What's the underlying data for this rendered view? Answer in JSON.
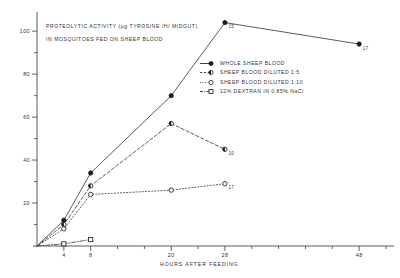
{
  "figure": {
    "title_line1": "PROTEOLYTIC ACTIVITY (µg TYROSINE /H/ MIDGUT)",
    "title_line2": "IN MOSQUITOES FED ON SHEEP BLOOD"
  },
  "axes": {
    "x_axis_title": "HOURS AFTER FEEDING",
    "y_tick_labels": [
      "20",
      "40",
      "60",
      "80",
      "100"
    ],
    "x_tick_labels": [
      "4",
      "8",
      "20",
      "28",
      "48"
    ]
  },
  "legend": {
    "items": [
      {
        "label": "WHOLE SHEEP BLOOD",
        "marker": "filled-circle",
        "line": "solid"
      },
      {
        "label": "SHEEP BLOOD DILUTED 1:5",
        "marker": "half-filled-circle",
        "line": "dashed"
      },
      {
        "label": "SHEEP BLOOD DILUTED 1:10",
        "marker": "open-circle",
        "line": "dotted"
      },
      {
        "label": "12% DEXTRAN IN 0.85% NaCl",
        "marker": "open-square",
        "line": "dash-dot"
      }
    ]
  },
  "chart_data": {
    "type": "line",
    "title": "PROTEOLYTIC ACTIVITY (µg TYROSINE /H/ MIDGUT) IN MOSQUITOES FED ON SHEEP BLOOD",
    "xlabel": "HOURS AFTER FEEDING",
    "ylabel": "PROTEOLYTIC ACTIVITY (µg TYROSINE /H/ MIDGUT)",
    "xlim": [
      0,
      52
    ],
    "ylim": [
      0,
      108
    ],
    "xticks": [
      4,
      8,
      20,
      28,
      48
    ],
    "yticks": [
      20,
      40,
      60,
      80,
      100
    ],
    "grid": false,
    "legend_position": "upper-right-inside",
    "series": [
      {
        "name": "WHOLE SHEEP BLOOD",
        "marker": "filled-circle",
        "line": "solid",
        "x": [
          0,
          4,
          8,
          20,
          28,
          48
        ],
        "y": [
          0,
          12,
          34,
          70,
          104,
          94
        ],
        "point_annotations": [
          "",
          "",
          "",
          "",
          "15",
          "17"
        ]
      },
      {
        "name": "SHEEP BLOOD DILUTED 1:5",
        "marker": "half-filled-circle",
        "line": "dashed",
        "x": [
          0,
          4,
          8,
          20,
          28
        ],
        "y": [
          0,
          10,
          28,
          57,
          45
        ],
        "point_annotations": [
          "",
          "",
          "",
          "",
          "10"
        ]
      },
      {
        "name": "SHEEP BLOOD DILUTED 1:10",
        "marker": "open-circle",
        "line": "dotted",
        "x": [
          0,
          4,
          8,
          20,
          28
        ],
        "y": [
          0,
          8,
          24,
          26,
          29
        ],
        "point_annotations": [
          "",
          "",
          "",
          "",
          "17"
        ]
      },
      {
        "name": "12% DEXTRAN IN 0.85% NaCl",
        "marker": "open-square",
        "line": "dash-dot",
        "x": [
          0,
          4,
          8
        ],
        "y": [
          0,
          1,
          3
        ],
        "point_annotations": [
          "",
          "",
          ""
        ]
      }
    ],
    "annotations": [
      {
        "text": "15",
        "series": "WHOLE SHEEP BLOOD",
        "at_x": 28,
        "at_y": 104
      },
      {
        "text": "17",
        "series": "WHOLE SHEEP BLOOD",
        "at_x": 48,
        "at_y": 94
      },
      {
        "text": "10",
        "series": "SHEEP BLOOD DILUTED 1:5",
        "at_x": 28,
        "at_y": 45
      },
      {
        "text": "17",
        "series": "SHEEP BLOOD DILUTED 1:10",
        "at_x": 28,
        "at_y": 29
      }
    ]
  }
}
